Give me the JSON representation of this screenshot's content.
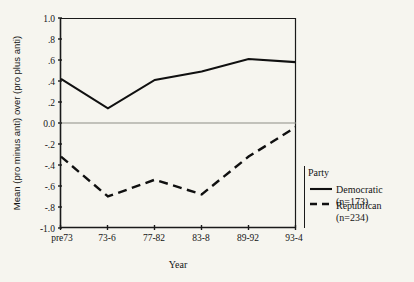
{
  "chart_data": {
    "type": "line",
    "title": "",
    "xlabel": "Year",
    "ylabel": "Mean (pro minus anti) over (pro plus anti)",
    "categories": [
      "pre73",
      "73-6",
      "77-82",
      "83-8",
      "89-92",
      "93-4"
    ],
    "series": [
      {
        "name": "Democratic",
        "sublabel": "(n=173)",
        "style": "solid",
        "color": "#101010",
        "values": [
          0.42,
          0.14,
          0.41,
          0.49,
          0.61,
          0.58
        ]
      },
      {
        "name": "Republican",
        "sublabel": "(n=234)",
        "style": "dashed",
        "color": "#101010",
        "values": [
          -0.32,
          -0.7,
          -0.54,
          -0.68,
          -0.32,
          -0.04
        ]
      }
    ],
    "ylim": [
      -1.0,
      1.0
    ],
    "yticks": [
      1.0,
      0.8,
      0.6,
      0.4,
      0.2,
      0.0,
      -0.2,
      -0.4,
      -0.6,
      -0.8,
      -1.0
    ],
    "ytick_labels": [
      "1.0",
      ".8",
      ".6",
      ".4",
      ".2",
      "0.0",
      "-.2",
      "-.4",
      "-.6",
      "-.8",
      "-1.0"
    ],
    "grid": false,
    "zero_line": true,
    "legend_position": "right"
  },
  "axes": {
    "y_title": "Mean (pro minus anti) over (pro plus anti)",
    "x_title": "Year",
    "y_labels": {
      "t0": "1.0",
      "t1": ".8",
      "t2": ".6",
      "t3": ".4",
      "t4": ".2",
      "t5": "0.0",
      "t6": "-.2",
      "t7": "-.4",
      "t8": "-.6",
      "t9": "-.8",
      "t10": "-1.0"
    },
    "x_labels": {
      "c0": "pre73",
      "c1": "73-6",
      "c2": "77-82",
      "c3": "83-8",
      "c4": "89-92",
      "c5": "93-4"
    }
  },
  "legend": {
    "title": "Party",
    "entries": [
      {
        "label": "Democratic",
        "sublabel": "(n=173)",
        "style": "solid"
      },
      {
        "label": "Republican",
        "sublabel": "(n=234)",
        "style": "dashed"
      }
    ],
    "entry0_label": "Democratic",
    "entry0_sublabel": "(n=173)",
    "entry1_label": "Republican",
    "entry1_sublabel": "(n=234)"
  },
  "colors": {
    "background": "#f6f5ef",
    "ink": "#101010",
    "zero_line": "#8d8d85"
  }
}
